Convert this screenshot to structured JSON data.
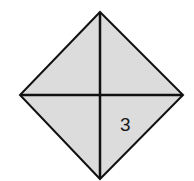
{
  "diagram": {
    "shape": "square rotated 45 degrees (diamond) divided into four triangles by its diagonals",
    "fill_color": "#dcdcdc",
    "stroke_color": "#111111",
    "vertices": {
      "top": [
        100,
        12
      ],
      "left": [
        20,
        95
      ],
      "right": [
        183,
        95
      ],
      "bottom": [
        100,
        179
      ]
    },
    "regions": [
      {
        "name": "top-left",
        "label": ""
      },
      {
        "name": "top-right",
        "label": ""
      },
      {
        "name": "bottom-left",
        "label": ""
      },
      {
        "name": "bottom-right",
        "label": "3"
      }
    ]
  }
}
